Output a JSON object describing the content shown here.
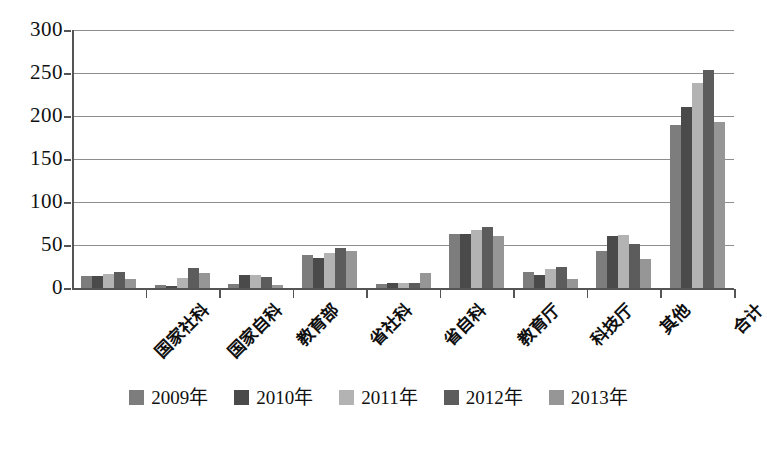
{
  "chart_data": {
    "type": "bar",
    "title": "",
    "subtitle": "",
    "xlabel": "",
    "ylabel": "",
    "ylim": [
      0,
      300
    ],
    "yticks": [
      0,
      50,
      100,
      150,
      200,
      250,
      300
    ],
    "grid": true,
    "legend_position": "bottom",
    "categories": [
      "国家社科",
      "国家自科",
      "教育部",
      "省社科",
      "省自科",
      "教育厅",
      "科技厅",
      "其他",
      "合计"
    ],
    "series": [
      {
        "name": "2009年",
        "color": "#7d7d7d",
        "values": [
          14,
          3,
          5,
          38,
          5,
          63,
          19,
          43,
          190
        ]
      },
      {
        "name": "2010年",
        "color": "#4a4a4a",
        "values": [
          14,
          2,
          15,
          35,
          6,
          63,
          15,
          61,
          211
        ]
      },
      {
        "name": "2011年",
        "color": "#b3b3b3",
        "values": [
          16,
          12,
          15,
          41,
          6,
          68,
          22,
          62,
          238
        ]
      },
      {
        "name": "2012年",
        "color": "#5c5c5c",
        "values": [
          19,
          23,
          13,
          46,
          6,
          71,
          25,
          51,
          253
        ]
      },
      {
        "name": "2013年",
        "color": "#969696",
        "values": [
          11,
          17,
          4,
          43,
          17,
          61,
          10,
          34,
          193
        ]
      }
    ]
  }
}
